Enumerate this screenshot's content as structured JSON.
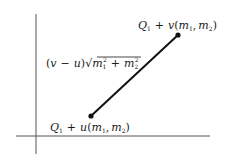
{
  "diagram": {
    "type": "line-segment-in-plane",
    "axes": {
      "x_axis": true,
      "y_axis": true
    },
    "segment": {
      "start_label": {
        "prefix": "Q",
        "prefix_sub": "1",
        "plus": "+",
        "param": "u",
        "open": "(",
        "m1": "m",
        "m1_sub": "1",
        "comma": ",",
        "m2": "m",
        "m2_sub": "2",
        "close": ")"
      },
      "end_label": {
        "prefix": "Q",
        "prefix_sub": "1",
        "plus": "+",
        "param": "v",
        "open": "(",
        "m1": "m",
        "m1_sub": "1",
        "comma": ",",
        "m2": "m",
        "m2_sub": "2",
        "close": ")"
      },
      "length_label": {
        "lparen": "(",
        "v": "v",
        "minus": "−",
        "u": "u",
        "rparen": ")",
        "sqrt": "√",
        "m1": "m",
        "m1_sub": "1",
        "m1_sup": "2",
        "plus": "+",
        "m2": "m",
        "m2_sub": "2",
        "m2_sup": "2"
      }
    },
    "colors": {
      "stroke": "#111111",
      "axis": "#555555",
      "text": "#1a1a1a"
    }
  }
}
